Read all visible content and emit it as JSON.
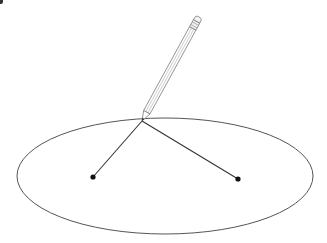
{
  "diagram": {
    "colors": {
      "background": "#ffffff",
      "ellipse_stroke": "#555555",
      "string_stroke": "#333333",
      "focus_fill": "#111111",
      "pencil_stroke": "#666666"
    },
    "ellipse": {
      "cx": 165,
      "cy": 176,
      "rx": 148,
      "ry": 58
    },
    "foci": [
      {
        "name": "focus-left",
        "x": 93,
        "y": 177
      },
      {
        "name": "focus-right",
        "x": 238,
        "y": 179
      }
    ],
    "pencil_tip": {
      "x": 142,
      "y": 121
    },
    "pencil_end": {
      "x": 199,
      "y": 17
    }
  }
}
